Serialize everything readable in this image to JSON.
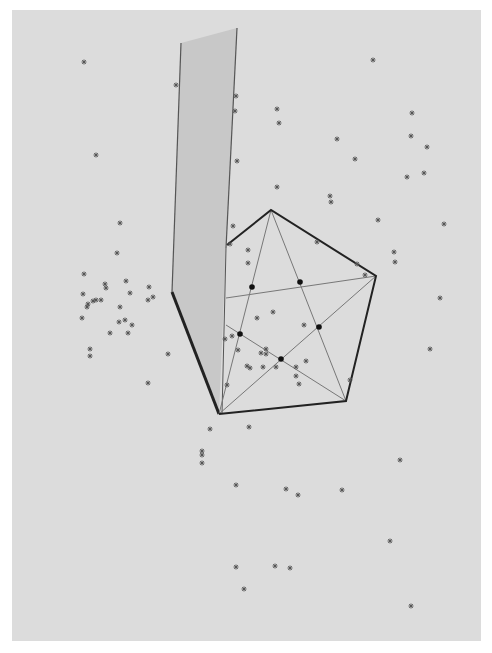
{
  "colors": {
    "background": "#ffffff",
    "panel": "#dcdcdc",
    "wall_fill": "#c8c8c8",
    "wall_edge": "#555555",
    "pentagon_edge": "#222222",
    "diagonal": "#777777",
    "marker": "#555555",
    "intersection_dot": "#111111"
  },
  "chart_data": {
    "type": "scatter",
    "title": "",
    "xlabel": "",
    "ylabel": "",
    "grid": false,
    "legend": null,
    "wall": {
      "polygon": [
        [
          181,
          43
        ],
        [
          237,
          28
        ],
        [
          226,
          248
        ],
        [
          219,
          414
        ],
        [
          172,
          292
        ]
      ]
    },
    "pentagon": {
      "vertices": [
        [
          271,
          210
        ],
        [
          376,
          276
        ],
        [
          346,
          401
        ],
        [
          219,
          414
        ],
        [
          227,
          245
        ]
      ]
    },
    "diagonal_lines": [
      [
        [
          271,
          210
        ],
        [
          346,
          401
        ]
      ],
      [
        [
          271,
          210
        ],
        [
          219,
          414
        ]
      ],
      [
        [
          376,
          276
        ],
        [
          219,
          414
        ]
      ],
      [
        [
          376,
          276
        ],
        [
          226,
          298
        ]
      ],
      [
        [
          226,
          325
        ],
        [
          346,
          401
        ]
      ]
    ],
    "intersection_points": [
      [
        252,
        287
      ],
      [
        300,
        282
      ],
      [
        319,
        327
      ],
      [
        240,
        334
      ],
      [
        281,
        359
      ]
    ],
    "points": [
      [
        84,
        62
      ],
      [
        96,
        155
      ],
      [
        176,
        85
      ],
      [
        236,
        96
      ],
      [
        235,
        111
      ],
      [
        237,
        161
      ],
      [
        277,
        109
      ],
      [
        279,
        123
      ],
      [
        337,
        139
      ],
      [
        355,
        159
      ],
      [
        373,
        60
      ],
      [
        412,
        113
      ],
      [
        411,
        136
      ],
      [
        427,
        147
      ],
      [
        407,
        177
      ],
      [
        424,
        173
      ],
      [
        277,
        187
      ],
      [
        330,
        196
      ],
      [
        331,
        202
      ],
      [
        378,
        220
      ],
      [
        444,
        224
      ],
      [
        394,
        252
      ],
      [
        395,
        262
      ],
      [
        230,
        244
      ],
      [
        233,
        226
      ],
      [
        248,
        250
      ],
      [
        248,
        263
      ],
      [
        317,
        242
      ],
      [
        357,
        264
      ],
      [
        365,
        275
      ],
      [
        120,
        223
      ],
      [
        117,
        253
      ],
      [
        84,
        274
      ],
      [
        105,
        284
      ],
      [
        106,
        288
      ],
      [
        126,
        281
      ],
      [
        149,
        287
      ],
      [
        83,
        294
      ],
      [
        88,
        304
      ],
      [
        93,
        301
      ],
      [
        96,
        300
      ],
      [
        101,
        300
      ],
      [
        87,
        307
      ],
      [
        120,
        307
      ],
      [
        125,
        320
      ],
      [
        119,
        322
      ],
      [
        132,
        325
      ],
      [
        82,
        318
      ],
      [
        148,
        300
      ],
      [
        153,
        297
      ],
      [
        110,
        333
      ],
      [
        90,
        349
      ],
      [
        90,
        356
      ],
      [
        128,
        333
      ],
      [
        168,
        354
      ],
      [
        148,
        383
      ],
      [
        130,
        293
      ],
      [
        257,
        318
      ],
      [
        273,
        312
      ],
      [
        304,
        325
      ],
      [
        266,
        349
      ],
      [
        266,
        354
      ],
      [
        261,
        353
      ],
      [
        247,
        366
      ],
      [
        263,
        367
      ],
      [
        276,
        367
      ],
      [
        296,
        367
      ],
      [
        306,
        361
      ],
      [
        296,
        376
      ],
      [
        299,
        384
      ],
      [
        250,
        368
      ],
      [
        238,
        350
      ],
      [
        227,
        385
      ],
      [
        232,
        336
      ],
      [
        225,
        339
      ],
      [
        350,
        380
      ],
      [
        440,
        298
      ],
      [
        430,
        349
      ],
      [
        210,
        429
      ],
      [
        249,
        427
      ],
      [
        202,
        451
      ],
      [
        202,
        455
      ],
      [
        202,
        463
      ],
      [
        236,
        485
      ],
      [
        286,
        489
      ],
      [
        298,
        495
      ],
      [
        342,
        490
      ],
      [
        400,
        460
      ],
      [
        390,
        541
      ],
      [
        236,
        567
      ],
      [
        275,
        566
      ],
      [
        290,
        568
      ],
      [
        411,
        606
      ],
      [
        244,
        589
      ]
    ]
  }
}
